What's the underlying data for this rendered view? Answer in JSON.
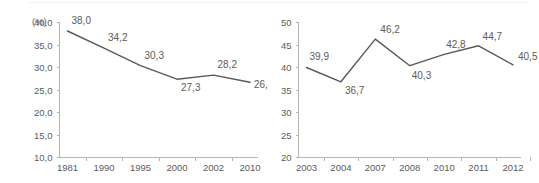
{
  "page": {
    "background_color": "#ffffff",
    "divider_color": "#f2f2f2",
    "axis_color": "#b4b4b4",
    "line_color": "#58585a",
    "text_color": "#5b5b5b"
  },
  "chart_data": [
    {
      "id": "left",
      "type": "line",
      "title": "",
      "xlabel": "",
      "ylabel": "(%)",
      "unit_label": "(%)",
      "categories": [
        "1981",
        "1990",
        "1995",
        "2000",
        "2002",
        "2010"
      ],
      "values": [
        38.0,
        34.2,
        30.3,
        27.3,
        28.2,
        26.6
      ],
      "value_labels": [
        "38,0",
        "34,2",
        "30,3",
        "27,3",
        "28,2",
        "26,6"
      ],
      "ytick_labels": [
        "40,0",
        "35,0",
        "30,0",
        "25,0",
        "20,0",
        "15,0",
        "10,0"
      ],
      "yticks": [
        40.0,
        35.0,
        30.0,
        25.0,
        20.0,
        15.0,
        10.0
      ],
      "ylim": [
        10.0,
        40.0
      ],
      "grid": false,
      "legend": false
    },
    {
      "id": "right",
      "type": "line",
      "title": "",
      "xlabel": "",
      "ylabel": "",
      "unit_label": "",
      "categories": [
        "2003",
        "2004",
        "2007",
        "2008",
        "2010",
        "2011",
        "2012"
      ],
      "values": [
        39.9,
        36.7,
        46.2,
        40.3,
        42.8,
        44.7,
        40.5
      ],
      "value_labels": [
        "39,9",
        "36,7",
        "46,2",
        "40,3",
        "42,8",
        "44,7",
        "40,5"
      ],
      "ytick_labels": [
        "50",
        "45",
        "40",
        "35",
        "30",
        "25",
        "20"
      ],
      "yticks": [
        50,
        45,
        40,
        35,
        30,
        25,
        20
      ],
      "ylim": [
        20,
        50
      ],
      "grid": false,
      "legend": false
    }
  ]
}
